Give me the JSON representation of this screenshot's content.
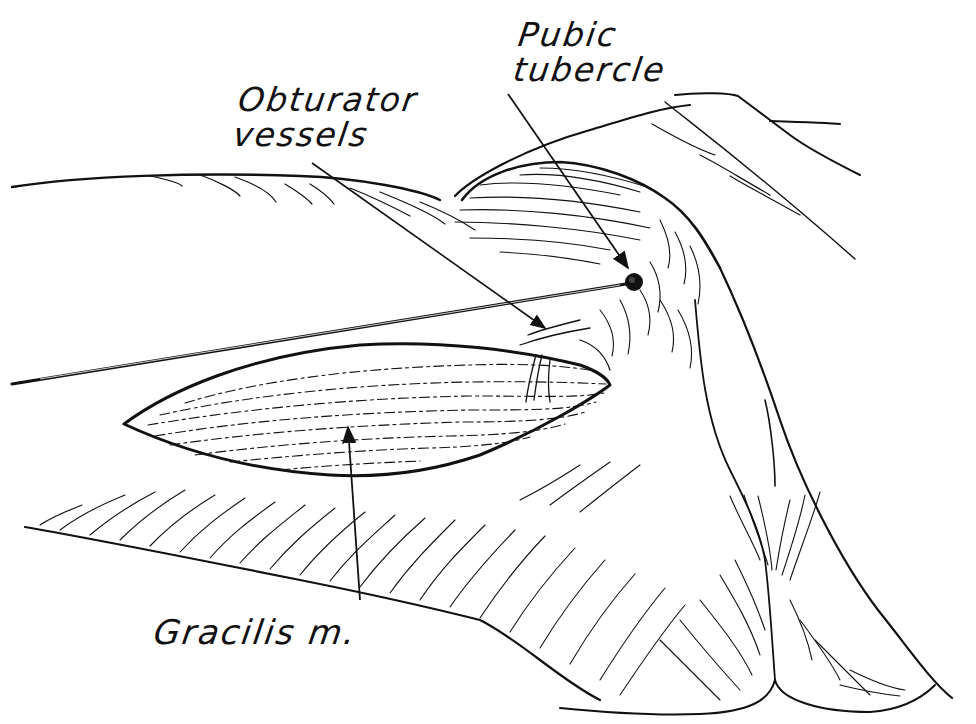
{
  "figure": {
    "type": "anatomical line drawing",
    "ink_color": "#111111",
    "background": "#ffffff"
  },
  "labels": {
    "pubic_tubercle": "Pubic\ntubercle",
    "obturator_vessels": "Obturator\nvessels",
    "gracilis": "Gracilis m."
  },
  "pointers": [
    {
      "label": "Pubic tubercle",
      "from": [
        508,
        94
      ],
      "to": [
        628,
        268
      ]
    },
    {
      "label": "Obturator vessels",
      "from": [
        312,
        163
      ],
      "to": [
        545,
        328
      ]
    },
    {
      "label": "Gracilis m.",
      "from": [
        360,
        600
      ],
      "to": [
        348,
        425
      ]
    }
  ],
  "structures": {
    "pin": {
      "head": [
        634,
        282
      ],
      "tail": [
        12,
        384
      ]
    }
  }
}
